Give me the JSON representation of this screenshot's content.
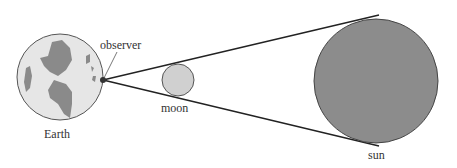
{
  "diagram": {
    "labels": {
      "observer": "observer",
      "earth": "Earth",
      "moon": "moon",
      "sun": "sun"
    },
    "colors": {
      "earth_fill": "#e6e6e6",
      "land_fill": "#8a8a8a",
      "moon_fill": "#d0d0d0",
      "sun_fill": "#8c8c8c",
      "line": "#222222"
    }
  }
}
